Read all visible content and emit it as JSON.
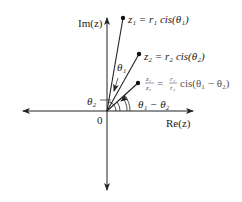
{
  "diagram": {
    "axes": {
      "imaginary_label": "Im(z)",
      "real_label": "Re(z)",
      "origin_label": "0"
    },
    "points": [
      {
        "id": "z1",
        "label": "z₁ = r₁ cis(θ₁)",
        "name": "z1",
        "angle_label": "θ₁"
      },
      {
        "id": "z2",
        "label": "z₂ = r₂ cis(θ₂)",
        "name": "z2",
        "angle_label": "θ₂"
      },
      {
        "id": "quotient",
        "label_lhs_num": "z₁",
        "label_lhs_den": "z₂",
        "label_eq": "=",
        "label_rhs_num": "r₁",
        "label_rhs_den": "r₂",
        "label_rhs_tail": "cis(θ₁ − θ₂)",
        "angle_label": "θ₁ − θ₂"
      }
    ],
    "angle_labels": {
      "theta1": "θ₁",
      "theta2": "θ₂",
      "diff": "θ₁ − θ₂"
    },
    "colors": {
      "line": "#222222",
      "text": "#222222",
      "background": "#ffffff"
    }
  }
}
